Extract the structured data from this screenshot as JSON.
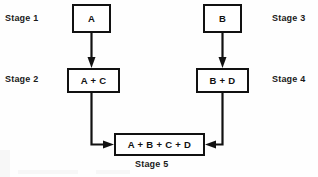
{
  "diagram": {
    "type": "flowchart",
    "title": "",
    "background_color": "#fefefe",
    "line_color": "#111111",
    "node_fill": "#ffffff",
    "nodes": [
      {
        "id": "a",
        "label": "A",
        "stage": "Stage 1",
        "x": 72,
        "y": 4,
        "w": 39,
        "h": 29
      },
      {
        "id": "ac",
        "label": "A + C",
        "stage": "Stage 2",
        "x": 67,
        "y": 68,
        "w": 53,
        "h": 25
      },
      {
        "id": "b",
        "label": "B",
        "stage": "Stage 3",
        "x": 203,
        "y": 4,
        "w": 39,
        "h": 29
      },
      {
        "id": "bd",
        "label": "B + D",
        "stage": "Stage 4",
        "x": 196,
        "y": 68,
        "w": 53,
        "h": 25
      },
      {
        "id": "abcd",
        "label": "A + B + C + D",
        "stage": "Stage 5",
        "x": 114,
        "y": 133,
        "w": 91,
        "h": 23
      }
    ],
    "stage_labels": [
      {
        "id": "stage-1",
        "text": "Stage 1",
        "x": 5,
        "y": 13
      },
      {
        "id": "stage-2",
        "text": "Stage 2",
        "x": 5,
        "y": 74
      },
      {
        "id": "stage-3",
        "text": "Stage 3",
        "x": 272,
        "y": 13
      },
      {
        "id": "stage-4",
        "text": "Stage 4",
        "x": 272,
        "y": 74
      },
      {
        "id": "stage-5",
        "text": "Stage 5",
        "x": 135,
        "y": 159
      }
    ],
    "edges": [
      {
        "id": "a-to-ac",
        "from": "a",
        "to": "ac",
        "direction": "down"
      },
      {
        "id": "b-to-bd",
        "from": "b",
        "to": "bd",
        "direction": "down"
      },
      {
        "id": "ac-to-abcd",
        "from": "ac",
        "to": "abcd",
        "direction": "down-then-right"
      },
      {
        "id": "bd-to-abcd",
        "from": "bd",
        "to": "abcd",
        "direction": "down-then-left"
      }
    ]
  }
}
